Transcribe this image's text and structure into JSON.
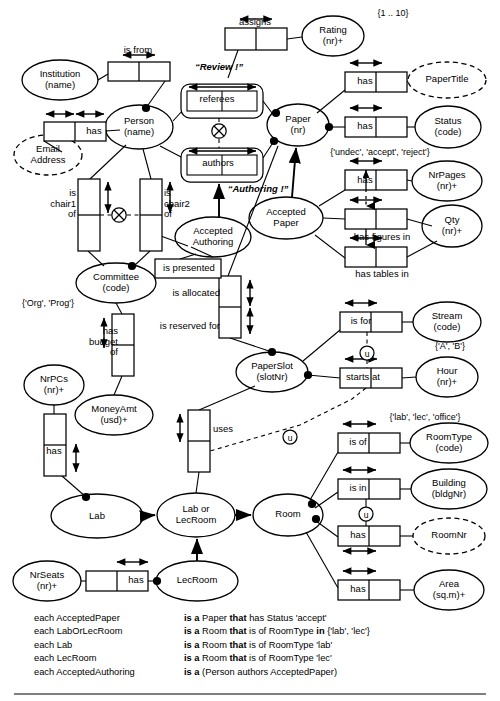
{
  "diagram": {
    "type": "orm-schema"
  },
  "entities": [
    {
      "id": "institution",
      "label": "Institution\n(name)",
      "name": "Institution",
      "ref": "(name)",
      "shape": "ellipse",
      "style": "solid",
      "x": 60,
      "y": 80,
      "rx": 38,
      "ry": 20
    },
    {
      "id": "person",
      "label": "Person\n(name)",
      "name": "Person",
      "ref": "(name)",
      "shape": "ellipse",
      "style": "solid",
      "x": 139,
      "y": 127,
      "rx": 34,
      "ry": 22
    },
    {
      "id": "email",
      "label": "Email\nAddress",
      "name": "Email Address",
      "ref": "",
      "shape": "ellipse",
      "style": "dashed",
      "x": 48,
      "y": 155,
      "rx": 34,
      "ry": 20
    },
    {
      "id": "rating",
      "label": "Rating\n(nr)+",
      "name": "Rating",
      "ref": "(nr)+",
      "shape": "ellipse",
      "style": "solid",
      "x": 333,
      "y": 36,
      "rx": 31,
      "ry": 20
    },
    {
      "id": "papertitle",
      "label": "PaperTitle",
      "name": "PaperTitle",
      "ref": "",
      "shape": "ellipse",
      "style": "dashed",
      "x": 447,
      "y": 80,
      "rx": 39,
      "ry": 18
    },
    {
      "id": "paper",
      "label": "Paper\n(nr)",
      "name": "Paper",
      "ref": "(nr)",
      "shape": "ellipse",
      "style": "solid",
      "x": 298,
      "y": 125,
      "rx": 31,
      "ry": 21
    },
    {
      "id": "status",
      "label": "Status\n(code)",
      "name": "Status",
      "ref": "(code)",
      "shape": "ellipse",
      "style": "solid",
      "x": 448,
      "y": 127,
      "rx": 33,
      "ry": 21
    },
    {
      "id": "nrpages",
      "label": "NrPages\n(nr)+",
      "name": "NrPages",
      "ref": "(nr)+",
      "shape": "ellipse",
      "style": "solid",
      "x": 447,
      "y": 181,
      "rx": 35,
      "ry": 20
    },
    {
      "id": "qty",
      "label": "Qty\n(nr)+",
      "name": "Qty",
      "ref": "(nr)+",
      "shape": "ellipse",
      "style": "solid",
      "x": 452,
      "y": 226,
      "rx": 30,
      "ry": 21
    },
    {
      "id": "acceptedpaper",
      "label": "Accepted\nPaper",
      "name": "AcceptedPaper",
      "ref": "",
      "shape": "ellipse",
      "style": "solid",
      "x": 286,
      "y": 218,
      "rx": 37,
      "ry": 21
    },
    {
      "id": "acceptedauthoring",
      "label": "Accepted\nAuthoring",
      "name": "AcceptedAuthoring",
      "ref": "",
      "shape": "ellipse",
      "style": "solid",
      "x": 213,
      "y": 237,
      "rx": 38,
      "ry": 20
    },
    {
      "id": "committee",
      "label": "Committee\n(code)",
      "name": "Committee",
      "ref": "(code)",
      "shape": "ellipse",
      "style": "solid",
      "x": 116,
      "y": 283,
      "rx": 40,
      "ry": 20
    },
    {
      "id": "stream",
      "label": "Stream\n(code)",
      "name": "Stream",
      "ref": "(code)",
      "shape": "ellipse",
      "style": "solid",
      "x": 447,
      "y": 322,
      "rx": 34,
      "ry": 20
    },
    {
      "id": "hour",
      "label": "Hour\n(nr)+",
      "name": "Hour",
      "ref": "(nr)+",
      "shape": "ellipse",
      "style": "solid",
      "x": 447,
      "y": 377,
      "rx": 31,
      "ry": 20
    },
    {
      "id": "paperslot",
      "label": "PaperSlot\n(slotNr)",
      "name": "PaperSlot",
      "ref": "(slotNr)",
      "shape": "ellipse",
      "style": "solid",
      "x": 272,
      "y": 372,
      "rx": 36,
      "ry": 20
    },
    {
      "id": "nrpcs",
      "label": "NrPCs\n(nr)+",
      "name": "NrPCs",
      "ref": "(nr)+",
      "shape": "ellipse",
      "style": "solid",
      "x": 54,
      "y": 385,
      "rx": 30,
      "ry": 20
    },
    {
      "id": "moneyamt",
      "label": "MoneyAmt\n(usd)+",
      "name": "MoneyAmt",
      "ref": "(usd)+",
      "shape": "ellipse",
      "style": "solid",
      "x": 114,
      "y": 415,
      "rx": 39,
      "ry": 20
    },
    {
      "id": "roomtype",
      "label": "RoomType\n(code)",
      "name": "RoomType",
      "ref": "(code)",
      "shape": "ellipse",
      "style": "solid",
      "x": 449,
      "y": 443,
      "rx": 39,
      "ry": 20
    },
    {
      "id": "building",
      "label": "Building\n(bldgNr)",
      "name": "Building",
      "ref": "(bldgNr)",
      "shape": "ellipse",
      "style": "solid",
      "x": 449,
      "y": 489,
      "rx": 38,
      "ry": 20
    },
    {
      "id": "roomnr",
      "label": "RoomNr",
      "name": "RoomNr",
      "ref": "",
      "shape": "ellipse",
      "style": "dashed",
      "x": 449,
      "y": 536,
      "rx": 36,
      "ry": 18
    },
    {
      "id": "area",
      "label": "Area\n(sq.m)+",
      "name": "Area",
      "ref": "(sq.m)+",
      "shape": "ellipse",
      "style": "solid",
      "x": 449,
      "y": 590,
      "rx": 35,
      "ry": 20
    },
    {
      "id": "lab",
      "label": "Lab",
      "name": "Lab",
      "ref": "",
      "shape": "ellipse",
      "style": "solid",
      "x": 97,
      "y": 516,
      "rx": 46,
      "ry": 22
    },
    {
      "id": "laborlecroom",
      "label": "Lab or\nLecRoom",
      "name": "LabOrLecRoom",
      "ref": "",
      "shape": "ellipse",
      "style": "solid",
      "x": 196,
      "y": 515,
      "rx": 39,
      "ry": 22
    },
    {
      "id": "room",
      "label": "Room",
      "name": "Room",
      "ref": "",
      "shape": "ellipse",
      "style": "solid",
      "x": 288,
      "y": 515,
      "rx": 35,
      "ry": 21
    },
    {
      "id": "lecroom",
      "label": "LecRoom",
      "name": "LecRoom",
      "ref": "",
      "shape": "ellipse",
      "style": "solid",
      "x": 197,
      "y": 581,
      "rx": 41,
      "ry": 20
    },
    {
      "id": "nrseats",
      "label": "NrSeats\n(nr)+",
      "name": "NrSeats",
      "ref": "(nr)+",
      "shape": "ellipse",
      "style": "solid",
      "x": 47,
      "y": 581,
      "rx": 34,
      "ry": 20
    }
  ],
  "predicates": [
    {
      "id": "is-from",
      "label": "is from",
      "x": 138,
      "y": 57,
      "roles": 2
    },
    {
      "id": "person-has-email",
      "label": "has",
      "x": 76,
      "y": 132,
      "roles": 2
    },
    {
      "id": "assigns",
      "label": "assigns",
      "x": 255,
      "y": 40,
      "roles": 2
    },
    {
      "id": "referees",
      "label": "referees",
      "x": 219,
      "y": 100,
      "roles": 2
    },
    {
      "id": "authors",
      "label": "authors",
      "x": 219,
      "y": 164,
      "roles": 2
    },
    {
      "id": "paper-has-title",
      "label": "has",
      "x": 383,
      "y": 82,
      "roles": 2
    },
    {
      "id": "paper-has-status",
      "label": "has",
      "x": 383,
      "y": 127,
      "roles": 2
    },
    {
      "id": "has-nrpages",
      "label": "has",
      "x": 383,
      "y": 180,
      "roles": 2
    },
    {
      "id": "has-figures-in",
      "label": "has figures in",
      "x": 383,
      "y": 219,
      "roles": 2
    },
    {
      "id": "has-tables-in",
      "label": "has tables in",
      "x": 383,
      "y": 257,
      "roles": 2
    },
    {
      "id": "is-chair1-of",
      "label": "is\nchair1\nof",
      "x": 88,
      "y": 208,
      "roles": 2,
      "vertical": true
    },
    {
      "id": "is-chair2-of",
      "label": "is\nchair2\nof",
      "x": 151,
      "y": 208,
      "roles": 2,
      "vertical": true
    },
    {
      "id": "is-presented",
      "label": "is presented",
      "x": 188,
      "y": 268,
      "roles": 1
    },
    {
      "id": "is-allocated",
      "label": "is allocated",
      "x": 228,
      "y": 293,
      "roles": 2,
      "vertical": true
    },
    {
      "id": "is-reserved-for",
      "label": "is reserved for",
      "x": 228,
      "y": 325,
      "roles": 2,
      "vertical": true
    },
    {
      "id": "has-budget-of",
      "label": "has\nbudget\nof",
      "x": 122,
      "y": 344,
      "roles": 2,
      "vertical": true
    },
    {
      "id": "lab-has-nrpcs",
      "label": "has",
      "x": 54,
      "y": 452,
      "roles": 2,
      "vertical": true
    },
    {
      "id": "is-for",
      "label": "is for",
      "x": 380,
      "y": 322,
      "roles": 2
    },
    {
      "id": "starts-at",
      "label": "starts at",
      "x": 380,
      "y": 378,
      "roles": 2
    },
    {
      "id": "uses",
      "label": "uses",
      "x": 198,
      "y": 440,
      "roles": 2,
      "vertical": true
    },
    {
      "id": "room-is-of-roomtype",
      "label": "is of",
      "x": 377,
      "y": 443,
      "roles": 2
    },
    {
      "id": "room-is-in",
      "label": "is in",
      "x": 377,
      "y": 489,
      "roles": 2
    },
    {
      "id": "room-has-roomnr",
      "label": "has",
      "x": 377,
      "y": 536,
      "roles": 2
    },
    {
      "id": "room-has-area",
      "label": "has",
      "x": 377,
      "y": 590,
      "roles": 2
    },
    {
      "id": "lecroom-has-nrseats",
      "label": "has",
      "x": 118,
      "y": 581,
      "roles": 2
    }
  ],
  "objectified": [
    {
      "id": "review",
      "label": "“Review !”",
      "x": 219,
      "y": 68
    },
    {
      "id": "authoring",
      "label": "“Authoring !”",
      "x": 258,
      "y": 190
    }
  ],
  "value_constraints": [
    {
      "id": "rating-range",
      "text": "{1 .. 10}",
      "x": 393,
      "y": 14
    },
    {
      "id": "status-values",
      "text": "{'undec', 'accept', 'reject'}",
      "x": 380,
      "y": 153
    },
    {
      "id": "committee-values",
      "text": "{'Org', 'Prog'}",
      "x": 48,
      "y": 305
    },
    {
      "id": "stream-values",
      "text": "{'A', 'B'}",
      "x": 450,
      "y": 347
    },
    {
      "id": "roomtype-values",
      "text": "{'lab', 'lec', 'office'}",
      "x": 425,
      "y": 418
    }
  ],
  "constraint_markers": [
    {
      "id": "exclusion-review-authoring",
      "symbol": "⊗",
      "x": 219,
      "y": 131
    },
    {
      "id": "exclusion-chair1-chair2",
      "symbol": "⊗",
      "x": 119,
      "y": 215
    },
    {
      "id": "uniqueness-external-stream-hour",
      "symbol": "u",
      "x": 367,
      "y": 353
    },
    {
      "id": "uniqueness-external-slot-room",
      "symbol": "u",
      "x": 290,
      "y": 437
    },
    {
      "id": "uniqueness-external-building-roomnr",
      "symbol": "u",
      "x": 366,
      "y": 514
    }
  ],
  "derivation_rules": {
    "rows": [
      {
        "subject": "each AcceptedPaper",
        "isa": "is a",
        "rest_pre": " Paper ",
        "that": "that",
        "rest_post": " has Status 'accept'"
      },
      {
        "subject": "each LabOrLecRoom",
        "isa": "is a",
        "rest_pre": " Room ",
        "that": "that",
        "rest_post": " is of RoomType in {'lab', 'lec'}"
      },
      {
        "subject": "each Lab",
        "isa": "is a",
        "rest_pre": " Room ",
        "that": "that",
        "rest_post": " is of RoomType 'lab'"
      },
      {
        "subject": "each LecRoom",
        "isa": "is a",
        "rest_pre": " Room ",
        "that": "that",
        "rest_post": " is of RoomType 'lec'"
      },
      {
        "subject": "each AcceptedAuthoring",
        "isa": "is a",
        "rest_pre": " (Person authors AcceptedPaper)",
        "that": "",
        "rest_post": ""
      }
    ]
  },
  "colors": {
    "stroke": "#000000",
    "background": "#ffffff",
    "text": "#000000"
  }
}
